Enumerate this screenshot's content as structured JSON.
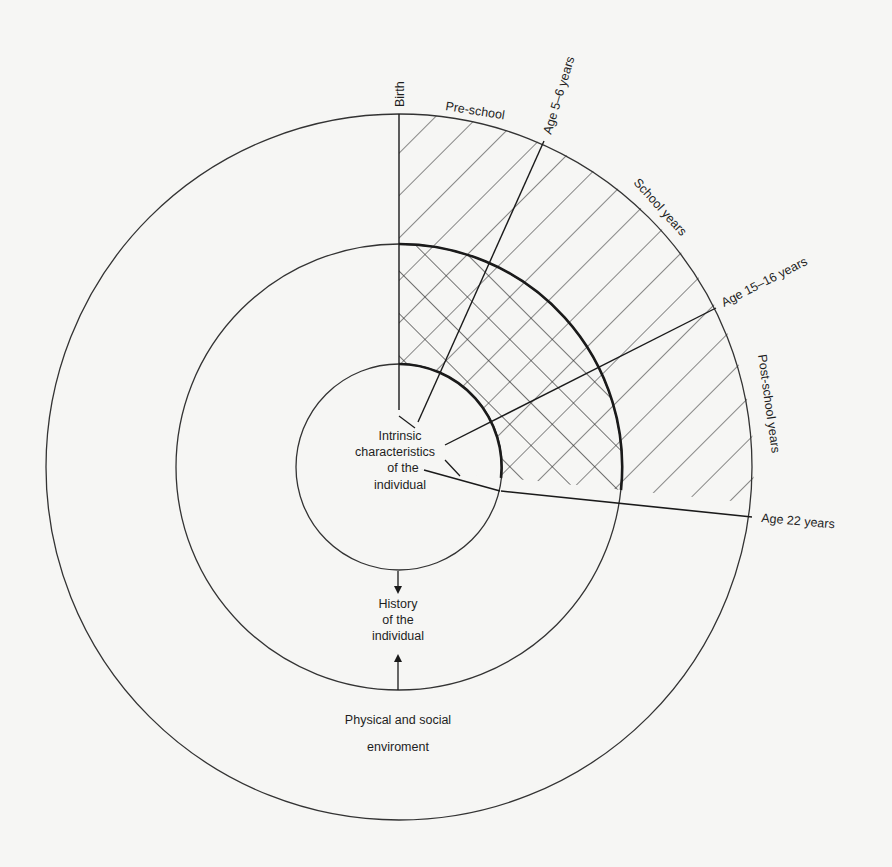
{
  "diagram": {
    "type": "concentric-circles-developmental-timeline",
    "center": {
      "x": 399,
      "y": 467
    },
    "circles": [
      {
        "name": "outer",
        "r": 353,
        "label_line1": "Physical and social",
        "label_line2": "enviroment"
      },
      {
        "name": "middle",
        "r": 223,
        "label_line1": "History",
        "label_line2": "of the",
        "label_line3": "individual"
      },
      {
        "name": "inner",
        "r": 103,
        "label_line1": "Intrinsic",
        "label_line2": "characteristics",
        "label_line3": "of the",
        "label_line4": "individual"
      }
    ],
    "milestones": {
      "birth": "Birth",
      "age_5_6": "Age 5–6 years",
      "age_15_16": "Age 15–16 years",
      "age_22": "Age 22 years"
    },
    "periods": {
      "pre_school": "Pre-school",
      "school_years": "School years",
      "post_school_years": "Post-school years"
    },
    "colors": {
      "line": "#1e1e1e",
      "paper": "#f6f6f4",
      "faint_text": "#e9e9e6"
    }
  }
}
